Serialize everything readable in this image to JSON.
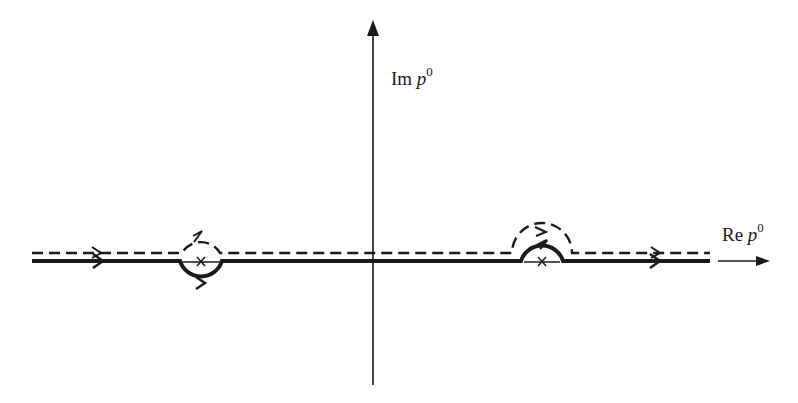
{
  "diagram": {
    "type": "complex-plane-contour",
    "axes": {
      "imaginary_label": {
        "prefix": "Im",
        "variable": "p",
        "superscript": "0"
      },
      "real_label": {
        "prefix": "Re",
        "variable": "p",
        "superscript": "0"
      }
    },
    "poles": [
      {
        "name": "left-pole",
        "marker": "×",
        "position": "negative real axis",
        "contour_solid": "loops below",
        "contour_dashed": "loops above"
      },
      {
        "name": "right-pole",
        "marker": "×",
        "position": "positive real axis",
        "contour_solid": "arches above",
        "contour_dashed": "arches above (outer)"
      }
    ],
    "contours": [
      {
        "name": "solid-contour",
        "style": "solid",
        "direction": "left-to-right"
      },
      {
        "name": "dashed-contour",
        "style": "dashed",
        "direction": "left-to-right"
      }
    ],
    "colors": {
      "ink": "#1a1a1a",
      "background": "#ffffff"
    }
  }
}
